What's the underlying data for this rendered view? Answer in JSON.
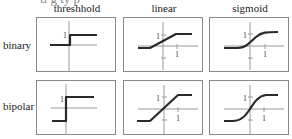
{
  "figure": {
    "clipped_caption": "tl    g ty  p",
    "columns": [
      {
        "id": "threshold",
        "label": "threshhold"
      },
      {
        "id": "linear",
        "label": "linear"
      },
      {
        "id": "sigmoid",
        "label": "sigmoid"
      }
    ],
    "rows": [
      {
        "id": "binary",
        "label": "binary"
      },
      {
        "id": "bipolar",
        "label": "bipolar"
      }
    ],
    "tick_label": "1",
    "colors": {
      "border": "#8a8a8a",
      "axis": "#9a9a9a",
      "curve": "#2a2a2a"
    }
  },
  "panels": {
    "binary_threshold": {
      "y_tick": "1"
    },
    "binary_linear": {
      "y_tick": "1",
      "x_tick": "1"
    },
    "binary_sigmoid": {
      "y_tick": "1",
      "x_tick": "1"
    },
    "bipolar_threshold": {
      "y_tick": "1"
    },
    "bipolar_linear": {
      "y_tick": "1",
      "x_tick": "1"
    },
    "bipolar_sigmoid": {
      "y_tick": "1",
      "x_tick": "1"
    }
  }
}
